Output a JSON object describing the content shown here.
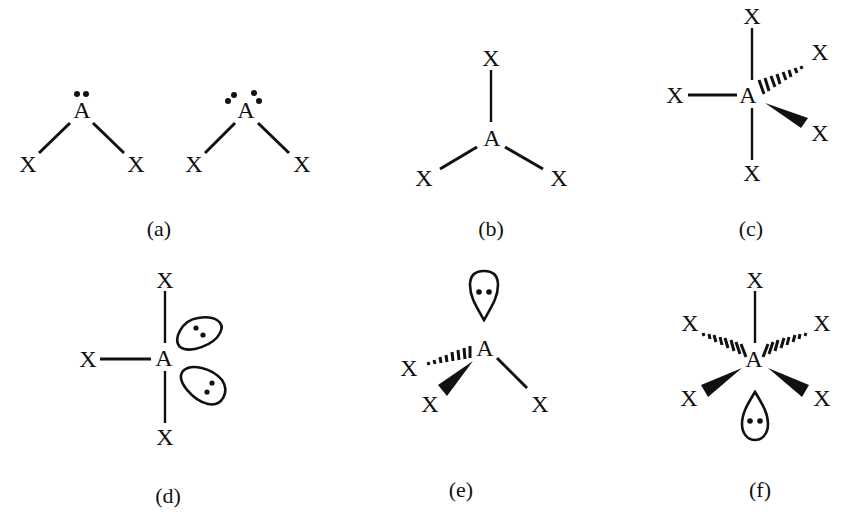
{
  "diagram": {
    "type": "VSEPR molecular geometries",
    "atom_labels": {
      "central": "A",
      "ligand": "X"
    },
    "panels": [
      {
        "id": "a",
        "label": "(a)",
        "description": "bent AX2 with one lone pair (two dots) and with two lone pairs (four dots)"
      },
      {
        "id": "b",
        "label": "(b)",
        "description": "trigonal planar AX3"
      },
      {
        "id": "c",
        "label": "(c)",
        "description": "trigonal bipyramidal AX5 with hashed and wedged bonds"
      },
      {
        "id": "d",
        "label": "(d)",
        "description": "T-shaped AX3 with two lone-pair lobes"
      },
      {
        "id": "e",
        "label": "(e)",
        "description": "trigonal pyramidal AX3 with one lone-pair lobe"
      },
      {
        "id": "f",
        "label": "(f)",
        "description": "square pyramidal AX5 with one lone-pair lobe"
      }
    ]
  },
  "text": {
    "A": "A",
    "X": "X",
    "label_a": "(a)",
    "label_b": "(b)",
    "label_c": "(c)",
    "label_d": "(d)",
    "label_e": "(e)",
    "label_f": "(f)"
  }
}
